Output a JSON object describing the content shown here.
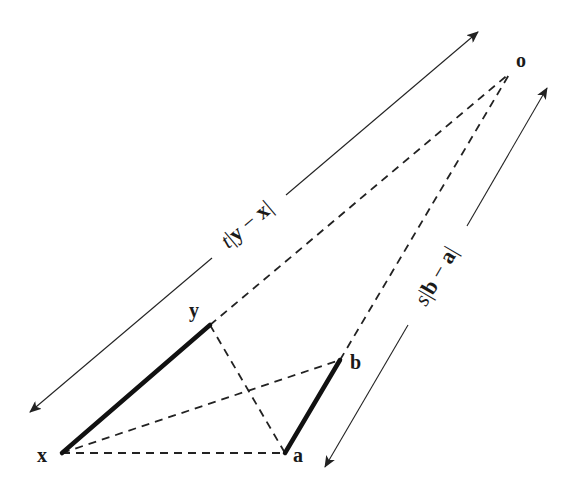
{
  "diagram": {
    "points": {
      "o": {
        "label": "o",
        "x": 510,
        "y": 73
      },
      "x": {
        "label": "x",
        "x": 62,
        "y": 453
      },
      "y": {
        "label": "y",
        "x": 210,
        "y": 325
      },
      "a": {
        "label": "a",
        "x": 285,
        "y": 453
      },
      "b": {
        "label": "b",
        "x": 340,
        "y": 360
      }
    },
    "solid_segments": [
      {
        "from": "x",
        "to": "y"
      },
      {
        "from": "a",
        "to": "b"
      }
    ],
    "dashed_segments": [
      {
        "from": "y",
        "to": "o"
      },
      {
        "from": "b",
        "to": "o"
      },
      {
        "from": "x",
        "to": "a"
      },
      {
        "from": "x",
        "to": "b"
      },
      {
        "from": "y",
        "to": "a"
      }
    ],
    "dimension_arrows": [
      {
        "name": "t-length",
        "label_parts": {
          "scalar": "t",
          "bar_open": "|",
          "v1": "y",
          "minus": " − ",
          "v2": "x",
          "bar_close": "|"
        },
        "from": [
          30,
          412
        ],
        "to": [
          478,
          32
        ]
      },
      {
        "name": "s-length",
        "label_parts": {
          "scalar": "s",
          "bar_open": "|",
          "v1": "b",
          "minus": " − ",
          "v2": "a",
          "bar_close": "|"
        },
        "from": [
          325,
          467
        ],
        "to": [
          547,
          88
        ]
      }
    ]
  }
}
